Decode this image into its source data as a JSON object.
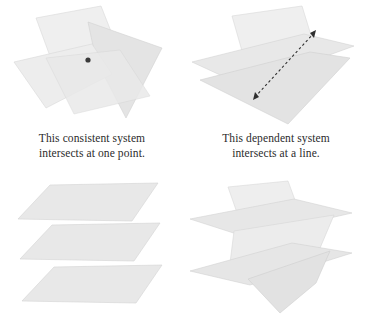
{
  "figure": {
    "background_color": "#ffffff",
    "plane_fill_light": "#f0f0f0",
    "plane_fill_mid": "#e6e6e6",
    "plane_fill_dark": "#dcdcdc",
    "plane_edge_color": "#cfcfcf",
    "marker_color": "#3a3a3a",
    "caption_color": "#2b2b2b"
  },
  "panels": [
    {
      "id": "consistent-one-point",
      "position": "top-left",
      "system_type": "consistent",
      "intersection": "one point",
      "plane_count": 3,
      "marker": "point",
      "caption": {
        "line1": "This consistent system",
        "line2": "intersects at one point."
      }
    },
    {
      "id": "dependent-line",
      "position": "top-right",
      "system_type": "dependent",
      "intersection": "a line",
      "plane_count": 3,
      "marker": "dashed-double-arrow-line",
      "caption": {
        "line1": "This dependent system",
        "line2": "intersects at a line."
      }
    },
    {
      "id": "parallel-planes",
      "position": "bottom-left",
      "system_type": "inconsistent",
      "intersection": "none",
      "plane_count": 3,
      "marker": "none",
      "caption": {
        "line1": "",
        "line2": ""
      }
    },
    {
      "id": "intersecting-planes-no-common",
      "position": "bottom-right",
      "system_type": "inconsistent",
      "intersection": "none",
      "plane_count": 3,
      "marker": "none",
      "caption": {
        "line1": "",
        "line2": ""
      }
    }
  ]
}
